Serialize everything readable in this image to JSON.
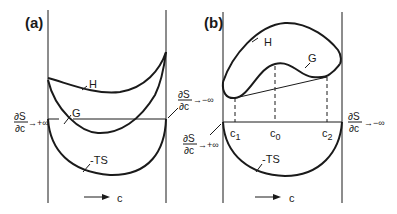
{
  "figure": {
    "panels": [
      {
        "id": "a",
        "label": "(a)",
        "curves": {
          "H": "H",
          "G": "G",
          "TS": "-TS"
        },
        "left_limit": {
          "num": "∂S",
          "den": "∂c",
          "arrow": "→+∞"
        },
        "right_limit": {
          "num": "∂S",
          "den": "∂c",
          "arrow": "→−∞"
        },
        "axis_label": "c"
      },
      {
        "id": "b",
        "label": "(b)",
        "curves": {
          "H": "H",
          "G": "G",
          "TS": "-TS"
        },
        "left_limit": {
          "num": "∂S",
          "den": "∂c",
          "arrow": "→+∞"
        },
        "right_limit": {
          "num": "∂S",
          "den": "∂c",
          "arrow": "→−∞"
        },
        "compositions": {
          "c1": "c",
          "c1_sub": "1",
          "c0": "c",
          "c0_sub": "0",
          "c2": "c",
          "c2_sub": "2"
        },
        "axis_label": "c"
      }
    ],
    "colors": {
      "ink": "#1a1a1a",
      "background": "#ffffff"
    }
  }
}
